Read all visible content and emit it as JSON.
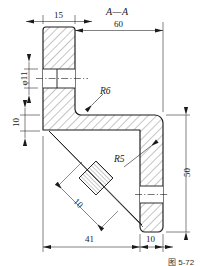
{
  "drawing": {
    "title": "A—A",
    "type": "engineering-section-view",
    "line_color": "#1a1a1a",
    "hatch_color": "#2b2b2b",
    "background": "#ffffff",
    "dimensions": [
      {
        "id": "d15",
        "label": "15",
        "orientation": "horizontal",
        "location": "top-left"
      },
      {
        "id": "d60",
        "label": "60",
        "orientation": "horizontal",
        "location": "top"
      },
      {
        "id": "dphi11",
        "label": "φ11",
        "orientation": "vertical",
        "location": "left-upper"
      },
      {
        "id": "d10L",
        "label": "10",
        "orientation": "vertical",
        "location": "left-lower"
      },
      {
        "id": "d50",
        "label": "50",
        "orientation": "vertical",
        "location": "right"
      },
      {
        "id": "d41",
        "label": "41",
        "orientation": "horizontal",
        "location": "bottom-left"
      },
      {
        "id": "d10B",
        "label": "10",
        "orientation": "horizontal",
        "location": "bottom-right"
      },
      {
        "id": "d10D",
        "label": "10",
        "orientation": "diagonal-45",
        "location": "center-rib"
      }
    ],
    "radii": [
      {
        "id": "r6",
        "label": "R6",
        "target": "inner-fillet"
      },
      {
        "id": "r5",
        "label": "R5",
        "target": "outer-fillet"
      }
    ],
    "caption": "图 5-72"
  }
}
